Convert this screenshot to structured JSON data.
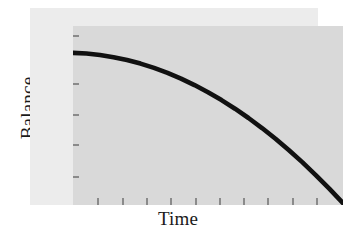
{
  "chart_data": {
    "type": "line",
    "title": "",
    "subtitle": "",
    "xlabel": "Time",
    "ylabel": "Balance",
    "grid": false,
    "legend": null,
    "legend_position": "none",
    "axis_tick_labels": {
      "x": [],
      "y": []
    },
    "xlim": [
      0,
      10
    ],
    "ylim": [
      0,
      10
    ],
    "annotations": [],
    "series": [
      {
        "name": "Balance",
        "color": "#111111",
        "line_width": 4,
        "x": [
          0.0,
          0.5,
          1.0,
          1.5,
          2.0,
          2.5,
          3.0,
          3.5,
          4.0,
          4.5,
          5.0,
          5.5,
          6.0,
          6.5,
          7.0,
          7.5,
          8.0,
          8.5,
          9.0,
          9.5,
          10.0
        ],
        "y": [
          8.5,
          8.46,
          8.38,
          8.26,
          8.1,
          7.9,
          7.66,
          7.38,
          7.06,
          6.7,
          6.3,
          5.86,
          5.38,
          4.86,
          4.3,
          3.7,
          3.06,
          2.38,
          1.66,
          0.9,
          0.1
        ]
      }
    ]
  },
  "axes": {
    "y_title": "Balance",
    "x_title": "Time",
    "y_tick_count": 5,
    "x_tick_count": 10,
    "y_tick_positions_pct": [
      5,
      32,
      49,
      66,
      84
    ],
    "x_tick_positions_pct": [
      9,
      18,
      27,
      36,
      45,
      54,
      63,
      72,
      81,
      90
    ]
  },
  "colors": {
    "page_background": "#ffffff",
    "frame_band": "#ececec",
    "plot_panel": "#d9d9d9",
    "curve": "#111111",
    "tick": "#8a8a8a",
    "text": "#1a1a1a"
  }
}
